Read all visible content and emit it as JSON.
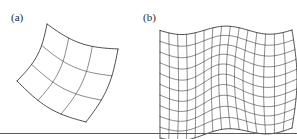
{
  "figure": {
    "width": 297,
    "height": 139,
    "background_color": "#ffffff",
    "line_color": "#3a3a3a",
    "boundary_color": "#232323",
    "rule_color": "#5b5b5b",
    "rule_y": 133
  },
  "panels": [
    {
      "id": "a",
      "label": "(a)",
      "label_x": 11,
      "label_y": 12,
      "description": "coarse curved quadrilateral mesh",
      "grid_columns": 3,
      "grid_rows": 3
    },
    {
      "id": "b",
      "label": "(b)",
      "label_x": 143,
      "label_y": 12,
      "description": "refined wavy quadrilateral mesh",
      "grid_columns": 15,
      "grid_rows": 10
    }
  ],
  "chart_data": {
    "type": "diagram",
    "title": "",
    "meshes": [
      {
        "name": "coarse-mesh",
        "panel": "a",
        "nu": 3,
        "nv": 3,
        "corners": {
          "top_left": [
            47,
            24
          ],
          "top_right": [
            118,
            49
          ],
          "bottom_right": [
            86,
            122
          ],
          "bottom_left": [
            17,
            81
          ]
        },
        "bulge_u": 7.0,
        "bulge_v": -6.0
      },
      {
        "name": "refined-mesh",
        "panel": "b",
        "nu": 15,
        "nv": 10,
        "bounds": {
          "x_min": 160,
          "x_max": 292,
          "y_min": 30,
          "y_max": 128
        },
        "wave_amplitude_x": 9.0,
        "wave_amplitude_y": 7.5,
        "wave_periods": 1.5,
        "shear": 10.0
      }
    ]
  }
}
